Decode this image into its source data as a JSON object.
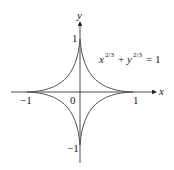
{
  "figure": {
    "equation": {
      "base_x": "x",
      "base_y": "y",
      "exponent": "2/3",
      "plus": "+",
      "equals": "= 1"
    },
    "axes": {
      "x_label": "x",
      "y_label": "y",
      "origin_label": "0",
      "x_ticks": [
        "−1",
        "1"
      ],
      "y_ticks": [
        "1",
        "−1"
      ]
    },
    "colors": {
      "curve": "#555555",
      "axis": "#222222"
    }
  }
}
